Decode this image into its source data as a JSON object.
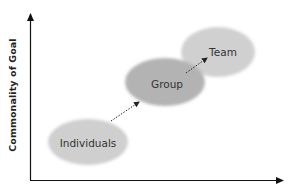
{
  "diagram": {
    "y_axis": {
      "label": "Commonality of Goal"
    },
    "x_axis": {
      "label": ""
    },
    "nodes": [
      {
        "id": "individuals",
        "label": "Individuals",
        "cx": 88,
        "cy": 142,
        "rx": 40,
        "ry": 23,
        "fill": "#cfcfcf"
      },
      {
        "id": "group",
        "label": "Group",
        "cx": 165,
        "cy": 82,
        "rx": 40,
        "ry": 24,
        "fill": "#b3b3b3"
      },
      {
        "id": "team",
        "label": "Team",
        "cx": 218,
        "cy": 52,
        "rx": 37,
        "ry": 25,
        "fill": "#d0d0d0"
      }
    ],
    "edges": [
      {
        "from": "individuals",
        "to": "group",
        "style": "dotted-arrow"
      },
      {
        "from": "group",
        "to": "team",
        "style": "dotted-arrow"
      }
    ],
    "colors": {
      "axis": "#111111",
      "text": "#333333",
      "arrow": "#222222"
    }
  }
}
